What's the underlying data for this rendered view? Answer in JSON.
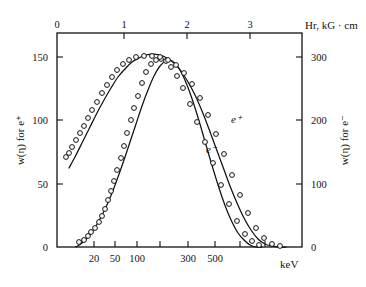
{
  "figure": {
    "background": "#ffffff",
    "ink": "#111111"
  },
  "chart_data": {
    "type": "line",
    "title": "",
    "subtitle": "",
    "xlabel": "keV",
    "xlabel_top": "Hr, kG · cm",
    "ylabel_left": "w(η) for e⁺",
    "ylabel_right": "w(η) for e⁻",
    "x_scale": "log-energy (keV), nonlinear, paired with linear Hr top axis",
    "x_top_ticks": [
      "0",
      "1",
      "2",
      "3"
    ],
    "x_top_tick_px": [
      57,
      124,
      187,
      250
    ],
    "x_bottom_ticks": [
      "20",
      "50",
      "100",
      "300",
      "500"
    ],
    "x_bottom_tick_px": [
      94,
      115,
      137,
      188,
      215
    ],
    "x_bottom_minor_px": [
      160,
      240,
      265
    ],
    "ylim_left": [
      0,
      165
    ],
    "y_left_ticks": [
      "0",
      "50",
      "100",
      "150"
    ],
    "y_left_tick_px": [
      247,
      184,
      120,
      57
    ],
    "ylim_right": [
      0,
      330
    ],
    "y_right_ticks": [
      "0",
      "100",
      "200",
      "300"
    ],
    "y_right_tick_px": [
      247,
      184,
      120,
      57
    ],
    "grid": false,
    "legend": "inline curve annotations",
    "series": [
      {
        "name": "e⁻",
        "label": "e⁻",
        "axis": "right",
        "label_px": [
          206,
          153
        ],
        "marker": "open-circle",
        "points_px": [
          [
            79,
            242
          ],
          [
            84,
            240
          ],
          [
            88,
            236
          ],
          [
            91,
            232
          ],
          [
            95,
            228
          ],
          [
            99,
            222
          ],
          [
            102,
            216
          ],
          [
            105,
            209
          ],
          [
            108,
            200
          ],
          [
            111,
            191
          ],
          [
            114,
            181
          ],
          [
            117,
            170
          ],
          [
            121,
            158
          ],
          [
            124,
            146
          ],
          [
            127,
            133
          ],
          [
            131,
            120
          ],
          [
            134,
            108
          ],
          [
            138,
            96
          ],
          [
            142,
            83
          ],
          [
            146,
            72
          ],
          [
            151,
            64
          ],
          [
            156,
            60
          ],
          [
            161,
            59
          ],
          [
            166,
            61
          ],
          [
            171,
            67
          ],
          [
            177,
            76
          ],
          [
            183,
            88
          ],
          [
            190,
            104
          ],
          [
            197,
            122
          ],
          [
            205,
            142
          ],
          [
            213,
            163
          ],
          [
            221,
            185
          ],
          [
            229,
            204
          ],
          [
            237,
            221
          ],
          [
            245,
            234
          ],
          [
            252,
            241
          ],
          [
            259,
            245
          ]
        ],
        "curve_px": [
          [
            76,
            247
          ],
          [
            82,
            243
          ],
          [
            88,
            237
          ],
          [
            94,
            229
          ],
          [
            100,
            219
          ],
          [
            106,
            207
          ],
          [
            112,
            193
          ],
          [
            118,
            177
          ],
          [
            124,
            160
          ],
          [
            130,
            142
          ],
          [
            136,
            124
          ],
          [
            142,
            106
          ],
          [
            148,
            90
          ],
          [
            154,
            76
          ],
          [
            160,
            66
          ],
          [
            166,
            61
          ],
          [
            172,
            61
          ],
          [
            178,
            67
          ],
          [
            184,
            78
          ],
          [
            190,
            93
          ],
          [
            196,
            111
          ],
          [
            202,
            131
          ],
          [
            208,
            152
          ],
          [
            214,
            172
          ],
          [
            220,
            191
          ],
          [
            226,
            208
          ],
          [
            232,
            222
          ],
          [
            238,
            233
          ],
          [
            244,
            240
          ],
          [
            250,
            245
          ],
          [
            256,
            247
          ],
          [
            262,
            247
          ]
        ]
      },
      {
        "name": "e⁺",
        "label": "e⁺",
        "axis": "left",
        "label_px": [
          231,
          123
        ],
        "marker": "open-circle",
        "points_px": [
          [
            66,
            157
          ],
          [
            69,
            153
          ],
          [
            72,
            147
          ],
          [
            76,
            140
          ],
          [
            80,
            133
          ],
          [
            84,
            126
          ],
          [
            88,
            118
          ],
          [
            92,
            110
          ],
          [
            97,
            102
          ],
          [
            102,
            93
          ],
          [
            107,
            85
          ],
          [
            112,
            77
          ],
          [
            117,
            70
          ],
          [
            123,
            64
          ],
          [
            129,
            60
          ],
          [
            136,
            57
          ],
          [
            144,
            56
          ],
          [
            152,
            56
          ],
          [
            160,
            57
          ],
          [
            168,
            60
          ],
          [
            176,
            65
          ],
          [
            184,
            73
          ],
          [
            192,
            84
          ],
          [
            200,
            98
          ],
          [
            208,
            115
          ],
          [
            216,
            134
          ],
          [
            224,
            154
          ],
          [
            232,
            175
          ],
          [
            240,
            195
          ],
          [
            248,
            213
          ],
          [
            256,
            228
          ],
          [
            264,
            238
          ],
          [
            272,
            244
          ],
          [
            280,
            246
          ]
        ],
        "curve_px": [
          [
            69,
            168
          ],
          [
            76,
            155
          ],
          [
            83,
            141
          ],
          [
            90,
            127
          ],
          [
            97,
            113
          ],
          [
            104,
            100
          ],
          [
            111,
            88
          ],
          [
            118,
            77
          ],
          [
            125,
            69
          ],
          [
            132,
            62
          ],
          [
            139,
            58
          ],
          [
            146,
            55
          ],
          [
            153,
            54
          ],
          [
            160,
            55
          ],
          [
            167,
            58
          ],
          [
            174,
            63
          ],
          [
            181,
            71
          ],
          [
            188,
            82
          ],
          [
            195,
            95
          ],
          [
            202,
            111
          ],
          [
            209,
            129
          ],
          [
            216,
            148
          ],
          [
            223,
            167
          ],
          [
            230,
            186
          ],
          [
            237,
            203
          ],
          [
            244,
            218
          ],
          [
            251,
            230
          ],
          [
            258,
            239
          ],
          [
            265,
            244
          ],
          [
            272,
            246
          ],
          [
            279,
            247
          ],
          [
            286,
            247
          ]
        ]
      }
    ]
  }
}
